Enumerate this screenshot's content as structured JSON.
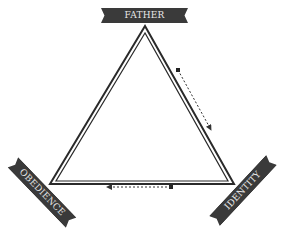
{
  "diagram": {
    "type": "triangle-cycle",
    "nodes": [
      {
        "id": "father",
        "label": "FATHER",
        "position": "top"
      },
      {
        "id": "identity",
        "label": "IDENTITY",
        "position": "bottom-right"
      },
      {
        "id": "obedience",
        "label": "OBEDIENCE",
        "position": "bottom-left"
      }
    ],
    "edges": [
      {
        "from": "father",
        "to": "identity",
        "style": "dotted-arrow",
        "side": "right"
      },
      {
        "from": "identity",
        "to": "obedience",
        "style": "dotted-arrow",
        "side": "bottom"
      }
    ],
    "colors": {
      "banner": "#3a3a3a",
      "banner_text": "#e8e8e8",
      "triangle_stroke": "#2a2a2a",
      "arrow": "#333333"
    }
  }
}
